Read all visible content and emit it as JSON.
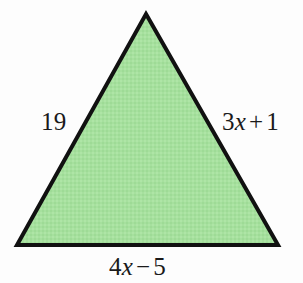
{
  "figure": {
    "type": "triangle-diagram",
    "background_color": "#fdfdfd",
    "fill_color": "#a6e09e",
    "stroke_color": "#111111",
    "stroke_width": 4,
    "vertices": {
      "apex": {
        "x": 146,
        "y": 14
      },
      "bottom_left": {
        "x": 17,
        "y": 245
      },
      "bottom_right": {
        "x": 278,
        "y": 245
      }
    }
  },
  "labels": {
    "left": {
      "text": "19",
      "parts": [
        {
          "text": "19",
          "style": "normal"
        }
      ]
    },
    "right": {
      "text": "3x + 1",
      "parts": [
        {
          "text": "3",
          "style": "normal"
        },
        {
          "text": "x",
          "style": "italic"
        },
        {
          "text": "+",
          "style": "operator"
        },
        {
          "text": "1",
          "style": "normal"
        }
      ]
    },
    "bottom": {
      "text": "4x − 5",
      "parts": [
        {
          "text": "4",
          "style": "normal"
        },
        {
          "text": "x",
          "style": "italic"
        },
        {
          "text": "−",
          "style": "operator"
        },
        {
          "text": "5",
          "style": "normal"
        }
      ]
    }
  }
}
